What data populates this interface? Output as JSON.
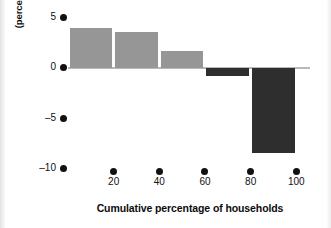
{
  "chart_data": {
    "type": "bar",
    "title": "",
    "subtitle": "",
    "xlabel": "Cumulative percentage of households",
    "ylabel_line1": "Redistribution",
    "ylabel_line2": "(percentage of total income)",
    "categories": [
      "20",
      "40",
      "60",
      "80",
      "100"
    ],
    "x": [
      20,
      40,
      60,
      80,
      100
    ],
    "bar_left_edges": [
      0,
      20,
      40,
      60,
      80
    ],
    "bar_right_edges": [
      20,
      40,
      60,
      80,
      100
    ],
    "values": [
      3.9,
      3.5,
      1.6,
      -0.8,
      -8.4
    ],
    "bar_colors": [
      "#969696",
      "#969696",
      "#969696",
      "#2e2e2e",
      "#2e2e2e"
    ],
    "xticks": [
      20,
      40,
      60,
      80,
      100
    ],
    "xtick_labels": [
      "20",
      "40",
      "60",
      "80",
      "100"
    ],
    "yticks": [
      5,
      0,
      -5,
      -10
    ],
    "ytick_labels": [
      "5",
      "0",
      "–5",
      "–10"
    ],
    "ylim": [
      -10.5,
      5.5
    ],
    "xlim": [
      0,
      106
    ],
    "grid": false,
    "legend": null,
    "baseline_value": 0,
    "series": [
      {
        "name": "Redistribution",
        "values": [
          3.9,
          3.5,
          1.6,
          -0.8,
          -8.4
        ]
      }
    ],
    "annotations": []
  },
  "colors": {
    "positive_bar": "#969696",
    "negative_bar": "#2e2e2e",
    "axis_text": "#111111",
    "baseline": "#b9b9b9",
    "background": "#ffffff"
  }
}
